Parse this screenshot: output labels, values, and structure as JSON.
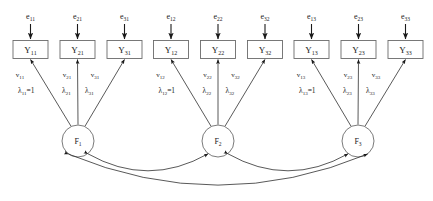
{
  "diagram": {
    "type": "path-diagram",
    "title": "",
    "canvas": {
      "width": 433,
      "height": 201
    },
    "colors": {
      "background": "#ffffff",
      "box_stroke": "#6b6b6b",
      "circle_stroke": "#6b6b6b",
      "arrow": "#2e2e2e",
      "text": "#1a1a1a"
    },
    "indicators": [
      {
        "base": "Y",
        "sub": "11",
        "cx": 30.5,
        "cy": 49.5
      },
      {
        "base": "Y",
        "sub": "21",
        "cx": 77.5,
        "cy": 49.5
      },
      {
        "base": "Y",
        "sub": "31",
        "cx": 124.5,
        "cy": 49.5
      },
      {
        "base": "Y",
        "sub": "12",
        "cx": 171.0,
        "cy": 49.5
      },
      {
        "base": "Y",
        "sub": "22",
        "cx": 218.0,
        "cy": 49.5
      },
      {
        "base": "Y",
        "sub": "32",
        "cx": 265.0,
        "cy": 49.5
      },
      {
        "base": "Y",
        "sub": "13",
        "cx": 311.5,
        "cy": 49.5
      },
      {
        "base": "Y",
        "sub": "23",
        "cx": 358.5,
        "cy": 49.5
      },
      {
        "base": "Y",
        "sub": "33",
        "cx": 405.5,
        "cy": 49.5
      }
    ],
    "errors": [
      {
        "base": "e",
        "sub": "11",
        "x": 30.5,
        "y": 19
      },
      {
        "base": "e",
        "sub": "21",
        "x": 77.5,
        "y": 19
      },
      {
        "base": "e",
        "sub": "31",
        "x": 124.5,
        "y": 19
      },
      {
        "base": "e",
        "sub": "12",
        "x": 171.0,
        "y": 19
      },
      {
        "base": "e",
        "sub": "22",
        "x": 218.0,
        "y": 19
      },
      {
        "base": "e",
        "sub": "32",
        "x": 265.0,
        "y": 19
      },
      {
        "base": "e",
        "sub": "13",
        "x": 311.5,
        "y": 19
      },
      {
        "base": "e",
        "sub": "23",
        "x": 358.5,
        "y": 19
      },
      {
        "base": "e",
        "sub": "33",
        "x": 405.5,
        "y": 19
      }
    ],
    "variances": [
      {
        "base": "v",
        "sub": "11",
        "x": 20,
        "y": 77
      },
      {
        "base": "v",
        "sub": "21",
        "x": 67,
        "y": 77
      },
      {
        "base": "v",
        "sub": "31",
        "x": 95,
        "y": 77
      },
      {
        "base": "v",
        "sub": "12",
        "x": 160.5,
        "y": 77
      },
      {
        "base": "v",
        "sub": "22",
        "x": 207.5,
        "y": 77
      },
      {
        "base": "v",
        "sub": "32",
        "x": 235.5,
        "y": 77
      },
      {
        "base": "v",
        "sub": "13",
        "x": 301,
        "y": 77
      },
      {
        "base": "v",
        "sub": "23",
        "x": 348,
        "y": 77
      },
      {
        "base": "v",
        "sub": "33",
        "x": 376,
        "y": 77
      }
    ],
    "loadings": [
      {
        "base": "λ",
        "sub": "11",
        "suffix": "=1",
        "x": 18,
        "y": 93
      },
      {
        "base": "λ",
        "sub": "21",
        "suffix": "",
        "x": 62,
        "y": 93
      },
      {
        "base": "λ",
        "sub": "31",
        "suffix": "",
        "x": 85,
        "y": 93
      },
      {
        "base": "λ",
        "sub": "12",
        "suffix": "=1",
        "x": 158.5,
        "y": 93
      },
      {
        "base": "λ",
        "sub": "22",
        "suffix": "",
        "x": 202.5,
        "y": 93
      },
      {
        "base": "λ",
        "sub": "32",
        "suffix": "",
        "x": 225.5,
        "y": 93
      },
      {
        "base": "λ",
        "sub": "13",
        "suffix": "=1",
        "x": 299,
        "y": 93
      },
      {
        "base": "λ",
        "sub": "23",
        "suffix": "",
        "x": 343,
        "y": 93
      },
      {
        "base": "λ",
        "sub": "33",
        "suffix": "",
        "x": 366,
        "y": 93
      }
    ],
    "factors": [
      {
        "base": "F",
        "sub": "1",
        "cx": 78,
        "cy": 141,
        "r": 16
      },
      {
        "base": "F",
        "sub": "2",
        "cx": 218,
        "cy": 141,
        "r": 16
      },
      {
        "base": "F",
        "sub": "3",
        "cx": 358,
        "cy": 141,
        "r": 16
      }
    ],
    "covariances": [
      {
        "from": "F1",
        "to": "F2",
        "label": ""
      },
      {
        "from": "F2",
        "to": "F3",
        "label": ""
      },
      {
        "from": "F1",
        "to": "F3",
        "label": ""
      }
    ]
  }
}
